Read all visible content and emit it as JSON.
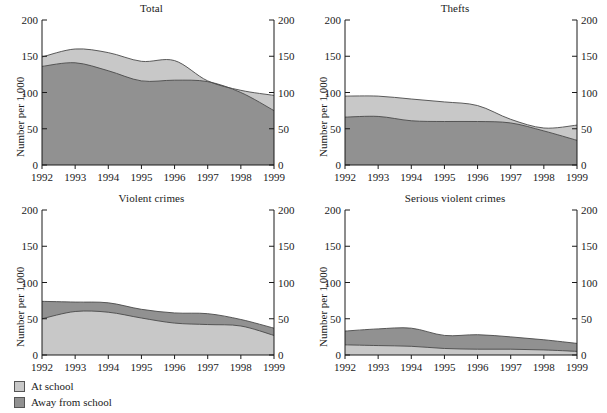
{
  "figure": {
    "ylabel": "Number per 1,000",
    "yticks": [
      0,
      50,
      100,
      150,
      200
    ],
    "xticks": [
      "1992",
      "1993",
      "1994",
      "1995",
      "1996",
      "1997",
      "1998",
      "1999"
    ],
    "colors": {
      "at_school": "#c8c8c8",
      "away_from_school": "#919191",
      "edge": "#4a4a4a",
      "axis": "#1a1a1a",
      "background": "#ffffff"
    }
  },
  "legend": {
    "position": "bottom-left",
    "items": [
      {
        "label": "At school",
        "color": "#c8c8c8"
      },
      {
        "label": "Away from school",
        "color": "#919191"
      }
    ]
  },
  "chart_data": [
    {
      "type": "area",
      "title": "Total",
      "stacked": true,
      "bottom_series": "Away from school",
      "xlabel": "",
      "ylabel": "Number per 1,000",
      "ylim": [
        0,
        200
      ],
      "x": [
        1992,
        1993,
        1994,
        1995,
        1996,
        1997,
        1998,
        1999
      ],
      "series": [
        {
          "name": "At school",
          "values": [
            13,
            19,
            25,
            27,
            27,
            1,
            3,
            21
          ]
        },
        {
          "name": "Away from school",
          "values": [
            136,
            141,
            130,
            116,
            117,
            115,
            100,
            75
          ]
        }
      ],
      "totals": [
        149,
        160,
        155,
        143,
        144,
        116,
        103,
        96
      ]
    },
    {
      "type": "area",
      "title": "Thefts",
      "stacked": true,
      "bottom_series": "Away from school",
      "xlabel": "",
      "ylabel": "Number per 1,000",
      "ylim": [
        0,
        200
      ],
      "x": [
        1992,
        1993,
        1994,
        1995,
        1996,
        1997,
        1998,
        1999
      ],
      "series": [
        {
          "name": "At school",
          "values": [
            29,
            28,
            30,
            27,
            22,
            5,
            4,
            21
          ]
        },
        {
          "name": "Away from school",
          "values": [
            66,
            67,
            61,
            60,
            60,
            58,
            47,
            34
          ]
        }
      ],
      "totals": [
        95,
        95,
        91,
        87,
        82,
        63,
        51,
        55
      ]
    },
    {
      "type": "area",
      "title": "Violent crimes",
      "stacked": true,
      "bottom_series": "At school",
      "xlabel": "",
      "ylabel": "Number per 1,000",
      "ylim": [
        0,
        200
      ],
      "x": [
        1992,
        1993,
        1994,
        1995,
        1996,
        1997,
        1998,
        1999
      ],
      "series": [
        {
          "name": "At school",
          "values": [
            50,
            60,
            59,
            51,
            44,
            42,
            40,
            27
          ]
        },
        {
          "name": "Away from school",
          "values": [
            24,
            13,
            13,
            12,
            14,
            15,
            9,
            10
          ]
        }
      ],
      "totals": [
        74,
        73,
        72,
        63,
        58,
        57,
        49,
        37
      ]
    },
    {
      "type": "area",
      "title": "Serious violent crimes",
      "stacked": true,
      "bottom_series": "At school",
      "xlabel": "",
      "ylabel": "Number per 1,000",
      "ylim": [
        0,
        200
      ],
      "x": [
        1992,
        1993,
        1994,
        1995,
        1996,
        1997,
        1998,
        1999
      ],
      "series": [
        {
          "name": "At school",
          "values": [
            14,
            13,
            12,
            9,
            8,
            8,
            7,
            5
          ]
        },
        {
          "name": "Away from school",
          "values": [
            19,
            23,
            25,
            18,
            20,
            17,
            14,
            11
          ]
        }
      ],
      "totals": [
        33,
        36,
        37,
        27,
        28,
        25,
        21,
        16
      ]
    }
  ]
}
